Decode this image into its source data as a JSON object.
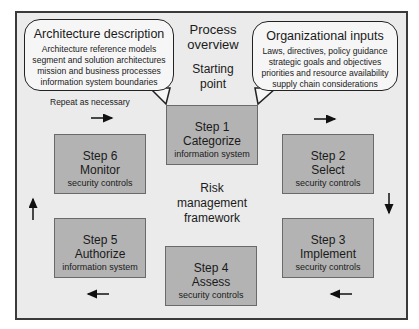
{
  "diagram": {
    "title_lines": [
      "Process",
      "overview"
    ],
    "start_lines": [
      "Starting",
      "point"
    ],
    "center_lines": [
      "Risk",
      "management",
      "framework"
    ],
    "repeat_label": "Repeat as necessary",
    "bubbles": {
      "left": {
        "title": "Architecture description",
        "lines": [
          "Architecture reference models",
          "segment and solution architectures",
          "mission and business processes",
          "information system boundaries"
        ]
      },
      "right": {
        "title": "Organizational inputs",
        "lines": [
          "Laws, directives, policy guidance",
          "strategic goals and objectives",
          "priorities and resource availability",
          "supply chain considerations"
        ]
      }
    },
    "steps": [
      {
        "step": "Step 1",
        "action": "Categorize",
        "object": "information system"
      },
      {
        "step": "Step 2",
        "action": "Select",
        "object": "security controls"
      },
      {
        "step": "Step 3",
        "action": "Implement",
        "object": "security controls"
      },
      {
        "step": "Step 4",
        "action": "Assess",
        "object": "security controls"
      },
      {
        "step": "Step 5",
        "action": "Authorize",
        "object": "information system"
      },
      {
        "step": "Step 6",
        "action": "Monitor",
        "object": "security controls"
      }
    ],
    "arrows": [
      "right",
      "right",
      "down",
      "left",
      "left",
      "up"
    ],
    "colors": {
      "step_fill": "#b3b3b3",
      "frame_fill": "#ebebeb",
      "bubble_fill": "#f6f6f6",
      "border": "#3a3a3a"
    }
  }
}
